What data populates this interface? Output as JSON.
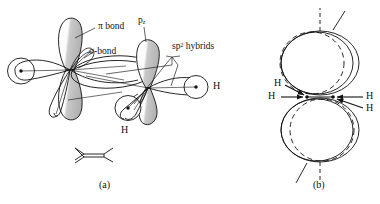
{
  "figure": {
    "ink_color": "#111111",
    "shade_color": "#b9b9b9",
    "background": "#ffffff"
  },
  "panel_a": {
    "caption": "(a)",
    "labels": {
      "pi_bond": "π bond",
      "sigma_bond": "σ-bond",
      "p_orbital_base": "p",
      "p_orbital_sub": "z",
      "sp2_hybrids_base": "sp",
      "sp2_hybrids_sup": "2",
      "sp2_hybrids_tail": " hybrids",
      "hydrogen_right": "H",
      "hydrogen_bottom": "H"
    },
    "skeletal_structure": "ethylene-double-bond-sketch"
  },
  "panel_b": {
    "caption": "(b)",
    "labels": {
      "h_upper_left": "H",
      "h_lower_left": "H",
      "h_upper_right": "H",
      "h_lower_right": "H"
    }
  }
}
